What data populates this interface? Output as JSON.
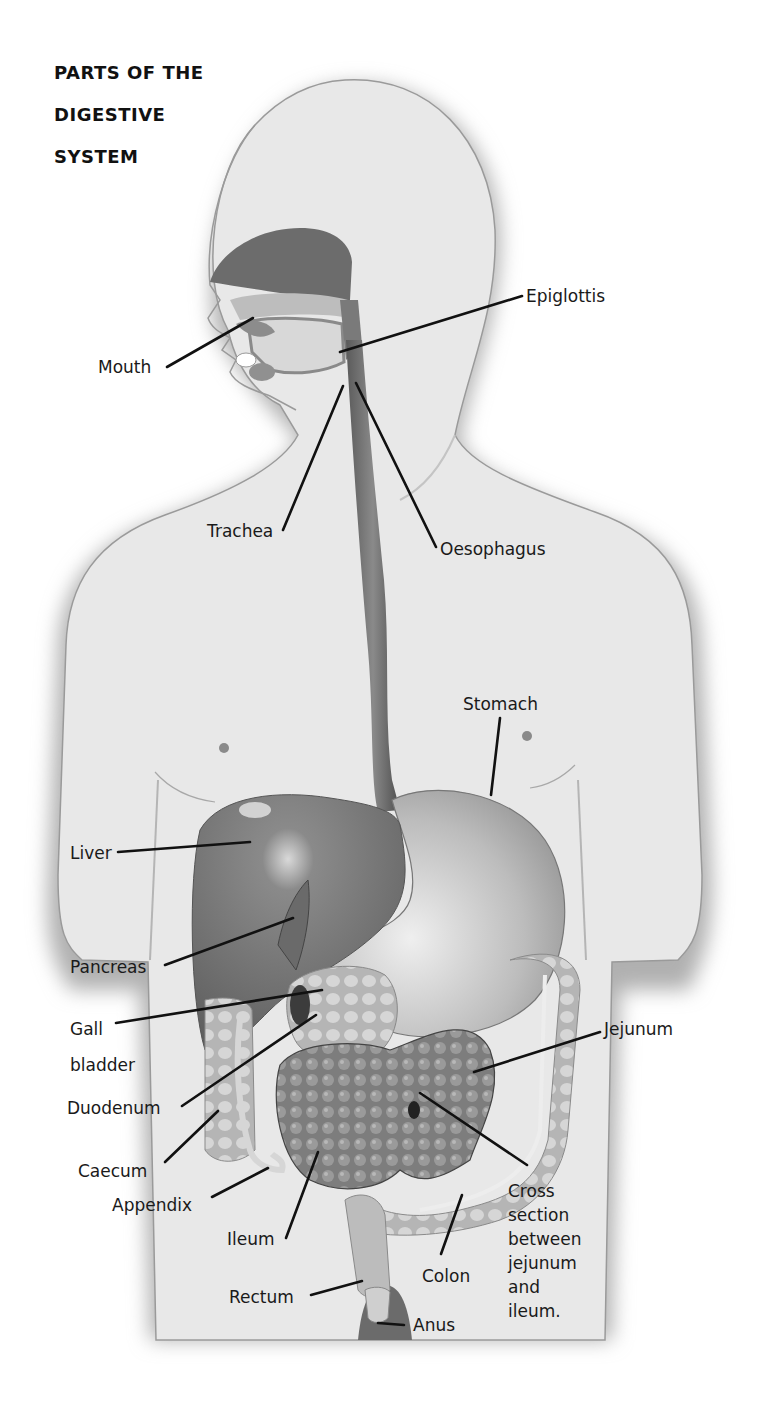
{
  "title": {
    "lines": [
      "PARTS OF THE",
      "DIGESTIVE",
      "SYSTEM"
    ]
  },
  "colors": {
    "background": "#ffffff",
    "body_fill": "#e6e6e6",
    "body_shadow": "#bdbdbd",
    "organ_dark": "#6f6f6f",
    "organ_mid": "#8e8e8e",
    "organ_light": "#cfcfcf",
    "leader_line": "#111111",
    "text": "#1a1a1a"
  },
  "labels": {
    "mouth": "Mouth",
    "epiglottis": "Epiglottis",
    "trachea": "Trachea",
    "oesophagus": "Oesophagus",
    "stomach": "Stomach",
    "liver": "Liver",
    "pancreas": "Pancreas",
    "gall_bladder": [
      "Gall",
      "bladder"
    ],
    "duodenum": "Duodenum",
    "jejunum": "Jejunum",
    "caecum": "Caecum",
    "appendix": "Appendix",
    "ileum": "Ileum",
    "cross_section": [
      "Cross",
      "section",
      "between",
      "jejunum",
      "and",
      "ileum."
    ],
    "colon": "Colon",
    "rectum": "Rectum",
    "anus": "Anus"
  }
}
